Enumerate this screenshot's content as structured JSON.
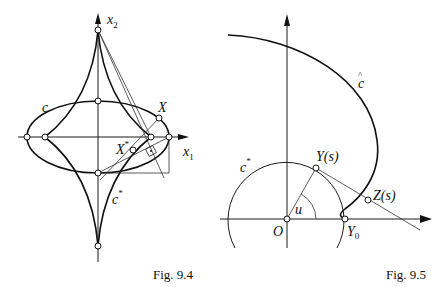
{
  "figures": [
    {
      "id": "fig-9-4",
      "caption": "Fig. 9.4",
      "labels": {
        "x2_axis": "x",
        "x2_sub": "2",
        "x1_axis": "x",
        "x1_sub": "1",
        "ellipse": "c",
        "evolute": "c",
        "evolute_sup": "*",
        "point_x": "X",
        "point_xstar": "X",
        "point_xstar_sup": "*"
      }
    },
    {
      "id": "fig-9-5",
      "caption": "Fig. 9.5",
      "labels": {
        "curve_hat": "c",
        "curve_hat_accent": "^",
        "circle": "c",
        "circle_sup": "*",
        "point_y": "Y(s)",
        "point_z": "Z(s)",
        "origin": "O",
        "angle": "u",
        "y0": "Y",
        "y0_sub": "0"
      }
    }
  ]
}
